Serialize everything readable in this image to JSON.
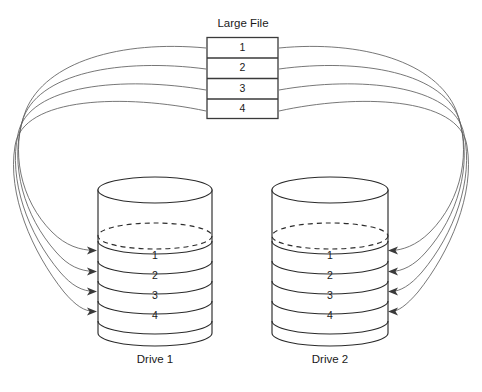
{
  "diagram": {
    "type": "raid-striping-illustration",
    "source_file": {
      "title": "Large File",
      "blocks": [
        {
          "label": "1"
        },
        {
          "label": "2"
        },
        {
          "label": "3"
        },
        {
          "label": "4"
        }
      ]
    },
    "drives": [
      {
        "caption": "Drive 1",
        "stripes": [
          {
            "label": "1"
          },
          {
            "label": "2"
          },
          {
            "label": "3"
          },
          {
            "label": "4"
          }
        ]
      },
      {
        "caption": "Drive 2",
        "stripes": [
          {
            "label": "1"
          },
          {
            "label": "2"
          },
          {
            "label": "3"
          },
          {
            "label": "4"
          }
        ]
      }
    ],
    "flow_arrows": {
      "left_count": 4,
      "right_count": 4,
      "direction": "file-blocks-to-drive-stripes"
    },
    "colors": {
      "background": "#ffffff",
      "outline": "#2b2b2b",
      "box_outline": "#3a3a3a",
      "flow_line": "#5e5e5e",
      "text": "#1a1a1a"
    }
  }
}
